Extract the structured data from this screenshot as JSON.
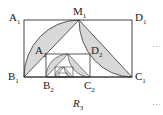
{
  "labels": {
    "A1": "A",
    "A1_sub": "1",
    "M1": "M",
    "M1_sub": "1",
    "D1": "D",
    "D1_sub": "1",
    "A2": "A",
    "A2_sub": "2",
    "D2": "D",
    "D2_sub": "2",
    "B1": "B",
    "B1_sub": "1",
    "B2": "B",
    "B2_sub": "2",
    "C2": "C",
    "C2_sub": "2",
    "C1": "C",
    "C1_sub": "1",
    "R": "R",
    "R_sub": "3"
  },
  "ellipsis_top": "···",
  "ellipsis_bottom": "···",
  "colors": {
    "fill": "#d8d8d8",
    "stroke": "#333333"
  }
}
